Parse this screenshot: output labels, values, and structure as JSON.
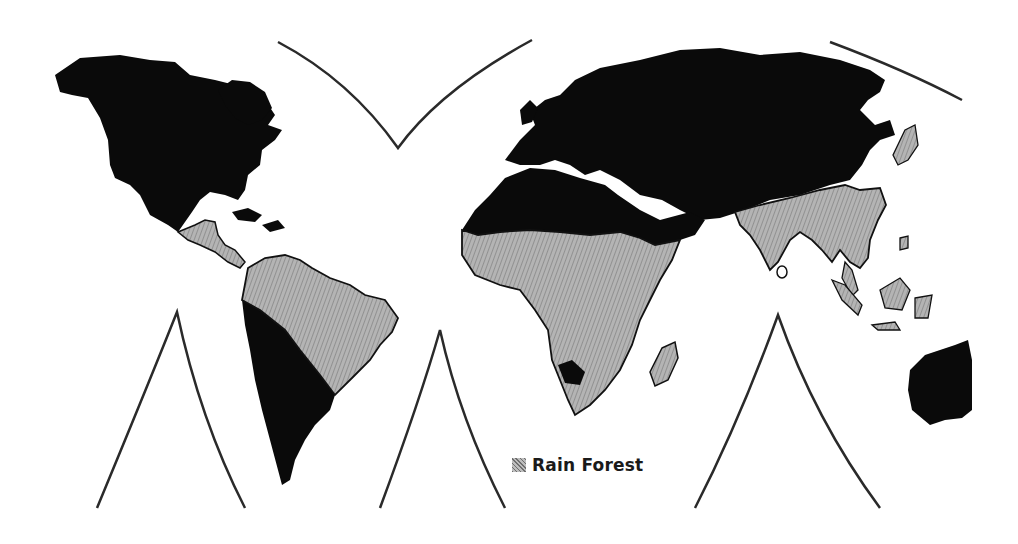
{
  "map": {
    "projection": "interrupted world map",
    "colors": {
      "background": "#ffffff",
      "land": "#0a0a0a",
      "rain_forest": "#a8a8a8",
      "lines": "#2a2a2a"
    },
    "regions": [
      {
        "name": "North America",
        "type": "land"
      },
      {
        "name": "Central America",
        "type": "rain_forest"
      },
      {
        "name": "South America - Amazon",
        "type": "rain_forest"
      },
      {
        "name": "South America - south/west",
        "type": "land"
      },
      {
        "name": "Eurasia",
        "type": "land"
      },
      {
        "name": "North Africa",
        "type": "land"
      },
      {
        "name": "Central/Southern Africa",
        "type": "rain_forest"
      },
      {
        "name": "Madagascar",
        "type": "rain_forest"
      },
      {
        "name": "India & Southeast Asia",
        "type": "rain_forest"
      },
      {
        "name": "Indonesia & islands",
        "type": "rain_forest"
      },
      {
        "name": "Japan",
        "type": "rain_forest"
      },
      {
        "name": "Australia",
        "type": "land"
      }
    ]
  },
  "legend": {
    "items": [
      {
        "label": "Rain Forest",
        "swatch": "rain-forest-pattern"
      }
    ]
  }
}
